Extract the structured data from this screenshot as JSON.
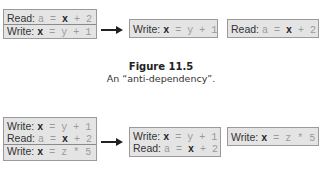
{
  "figure_top": {
    "source_box": {
      "lines": [
        {
          "label": "Read:",
          "pre": "a = ",
          "var": "x",
          "post": " + 2"
        },
        {
          "label": "Write:",
          "pre": "",
          "var": "x",
          "post": " = y + 1"
        }
      ]
    },
    "result_boxes": [
      {
        "lines": [
          {
            "label": "Write:",
            "pre": "",
            "var": "x",
            "post": " = y + 1"
          }
        ]
      },
      {
        "lines": [
          {
            "label": "Read:",
            "pre": "a = ",
            "var": "x",
            "post": " + 2"
          }
        ]
      }
    ],
    "caption_title": "Figure 11.5",
    "caption_text": "An “anti-dependency”."
  },
  "figure_bottom": {
    "source_box": {
      "lines": [
        {
          "label": "Write:",
          "pre": "",
          "var": "x",
          "post": " = y + 1"
        },
        {
          "label": "Read:",
          "pre": "a = ",
          "var": "x",
          "post": " + 2"
        },
        {
          "label": "Write:",
          "pre": "",
          "var": "x",
          "post": " = z * 5"
        }
      ]
    },
    "result_boxes": [
      {
        "lines": [
          {
            "label": "Write:",
            "pre": "",
            "var": "x",
            "post": " = y + 1"
          },
          {
            "label": "Read:",
            "pre": "a = ",
            "var": "x",
            "post": " + 2"
          }
        ]
      },
      {
        "lines": [
          {
            "label": "Write:",
            "pre": "",
            "var": "x",
            "post": " = z * 5"
          }
        ]
      }
    ]
  }
}
